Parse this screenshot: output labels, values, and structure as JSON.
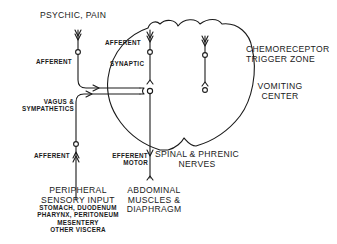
{
  "title_input": "PSYCHIC, PAIN",
  "labels": {
    "afferent_top_left": "AFFERENT",
    "afferent_inner": "AFFERENT",
    "synaptic": "SYNAPTIC",
    "vagus_line1": "VAGUS &",
    "vagus_line2": "SYMPATHETICS",
    "afferent_bottom": "AFFERENT",
    "efferent_line1": "EFFERENT",
    "efferent_line2": "MOTOR",
    "ctz_line1": "CHEMORECEPTOR",
    "ctz_line2": "TRIGGER ZONE",
    "vc_line1": "VOMITING",
    "vc_line2": "CENTER",
    "spinal_line1": "SPINAL & PHRENIC",
    "spinal_line2": "NERVES"
  },
  "peripheral": {
    "line1": "PERIPHERAL",
    "line2": "SENSORY INPUT",
    "items": [
      "STOMACH, DUODENUM",
      "PHARYNX, PERITONEUM",
      "MESENTERY",
      "OTHER VISCERA"
    ]
  },
  "abdominal": {
    "lines": [
      "ABDOMINAL",
      "MUSCLES &",
      "DIAPHRAGM"
    ]
  },
  "colors": {
    "ink": "#1a1a1a",
    "background": "#ffffff"
  }
}
